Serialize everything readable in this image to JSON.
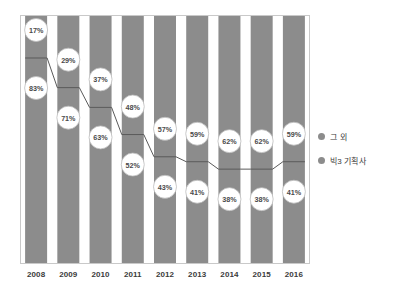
{
  "chart_data": {
    "type": "bar",
    "stacked": true,
    "title": "",
    "xlabel": "",
    "ylabel": "",
    "ylim": [
      0,
      100
    ],
    "grid": false,
    "legend_position": "right",
    "categories": [
      "2008",
      "2009",
      "2010",
      "2011",
      "2012",
      "2013",
      "2014",
      "2015",
      "2016"
    ],
    "series": [
      {
        "name": "그 외",
        "values": [
          17,
          29,
          37,
          48,
          57,
          59,
          62,
          62,
          59
        ],
        "labels": [
          "17%",
          "29%",
          "37%",
          "48%",
          "57%",
          "59%",
          "62%",
          "62%",
          "59%"
        ],
        "color": "#8c8c8c"
      },
      {
        "name": "빅3 기획사",
        "values": [
          83,
          71,
          63,
          52,
          43,
          41,
          38,
          38,
          41
        ],
        "labels": [
          "83%",
          "71%",
          "63%",
          "52%",
          "43%",
          "41%",
          "38%",
          "38%",
          "41%"
        ],
        "color": "#8c8c8c"
      }
    ]
  },
  "legend": {
    "items": [
      {
        "label": "그 외",
        "color": "#8c8c8c"
      },
      {
        "label": "빅3 기획사",
        "color": "#8c8c8c"
      }
    ]
  },
  "axis": {
    "x_ticks": [
      "2008",
      "2009",
      "2010",
      "2011",
      "2012",
      "2013",
      "2014",
      "2015",
      "2016"
    ]
  },
  "colors": {
    "bar": "#8c8c8c",
    "bubble_fill": "#ffffff",
    "bubble_stroke": "#bdbdbd",
    "divider_line": "#5a5a5a",
    "axis_line": "#c9c9c9",
    "text": "#3b3b3b"
  }
}
